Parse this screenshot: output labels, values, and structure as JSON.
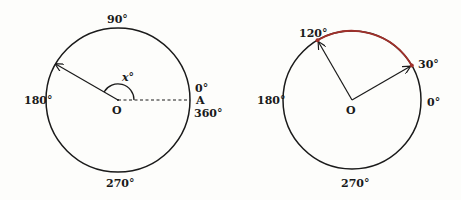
{
  "colors": {
    "ink": "#1a1a1a",
    "arc_highlight": "#a0302a",
    "background": "#fdfdfb"
  },
  "left_diagram": {
    "center_label": "O",
    "point_label": "A",
    "angle_label": "x°",
    "labels": {
      "deg_90": "90°",
      "deg_180": "180°",
      "deg_270": "270°",
      "deg_0": "0°",
      "deg_360": "360°"
    },
    "rotation_vector_angle_deg": 150
  },
  "right_diagram": {
    "center_label": "O",
    "labels": {
      "deg_120": "120°",
      "deg_30": "30°",
      "deg_180": "180°",
      "deg_0": "0°",
      "deg_270": "270°"
    },
    "vector_angles_deg": [
      30,
      120
    ],
    "highlighted_arc": {
      "from_deg": 30,
      "to_deg": 120
    }
  }
}
